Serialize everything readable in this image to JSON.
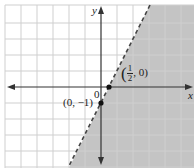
{
  "graph": {
    "inequality": "y < 2x - 1",
    "boundary_line": {
      "equation": "y = 2x - 1",
      "style": "dashed",
      "slope": 2,
      "y_intercept": -1
    },
    "shaded_region": "below/right of line",
    "axis_labels": {
      "x": "x",
      "y": "y"
    },
    "origin_label": "0",
    "points": [
      {
        "label_open": "(",
        "num": "1",
        "den": "2",
        "label_close": ", 0)",
        "x": 0.5,
        "y": 0
      },
      {
        "label": "(0, −1)",
        "x": 0,
        "y": -1
      }
    ],
    "colors": {
      "shade": "#c4c4c4",
      "grid": "#c8c8c8",
      "axis": "#333333",
      "line": "#444444",
      "background": "#ffffff"
    },
    "grid_spacing_units": 1
  }
}
